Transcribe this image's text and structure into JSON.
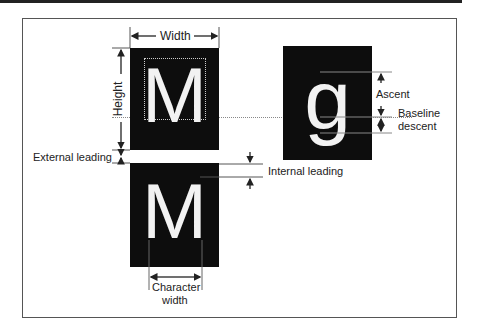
{
  "diagram": {
    "labels": {
      "width": "Width",
      "height": "Height",
      "ascent": "Ascent",
      "baseline": "Baseline",
      "descent": "descent",
      "external_leading": "External leading",
      "internal_leading": "Internal leading",
      "character": "Character",
      "character_width": "width"
    },
    "glyphs": {
      "top_char": "M",
      "bottom_char": "M",
      "descender_char": "g"
    },
    "colors": {
      "box": "#0d0d0d",
      "glyph": "#f2f2f2",
      "line": "#444444",
      "frame": "#555555"
    }
  }
}
